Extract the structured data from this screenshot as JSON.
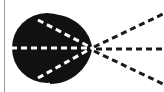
{
  "figure": {
    "colors": {
      "background": "#ffffff",
      "blob": "#111111",
      "inner_rays": "#ffffff",
      "outer_rays": "#1a1a1a",
      "border": "#9a9a9a"
    },
    "focal_point": {
      "x": 92,
      "y": 48
    },
    "blob": {
      "circle_cx": 47,
      "circle_cy": 48,
      "circle_r": 35
    },
    "inner_rays": [
      {
        "from": [
          38,
          20
        ],
        "to": [
          92,
          48
        ]
      },
      {
        "from": [
          12,
          48
        ],
        "to": [
          92,
          48
        ]
      },
      {
        "from": [
          38,
          78
        ],
        "to": [
          92,
          48
        ]
      }
    ],
    "outer_rays": [
      {
        "from": [
          92,
          48
        ],
        "to": [
          163,
          14
        ]
      },
      {
        "from": [
          92,
          48
        ],
        "to": [
          164,
          49
        ]
      },
      {
        "from": [
          92,
          48
        ],
        "to": [
          163,
          84
        ]
      }
    ]
  }
}
